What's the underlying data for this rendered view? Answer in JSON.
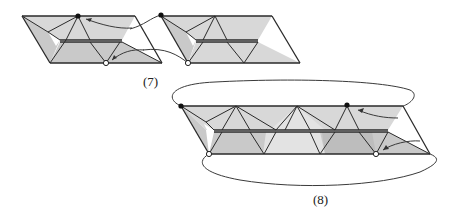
{
  "figures": [
    {
      "id": "fig7",
      "caption": "(7)",
      "description": "Two folded hexaflexagon strip segments connected by curved arrows; black dot marks top vertex, white dot marks bottom vertex",
      "pieces": 2,
      "markers": {
        "black_dots": 2,
        "white_dots": 2
      }
    },
    {
      "id": "fig8",
      "caption": "(8)",
      "description": "Joined strip of folded triangles forming a long parallelogram band, with looping connector curves above and below and arrows indicating folding",
      "pieces": 1,
      "markers": {
        "black_dots": 2,
        "white_dots": 2
      }
    }
  ],
  "colors": {
    "stroke": "#2a2a2a",
    "fill_light": "#e3e3e3",
    "fill_mid": "#d8d8d8",
    "fill_dark": "#c9c9c9",
    "fill_darker": "#bdbdbd",
    "background": "#ffffff"
  }
}
